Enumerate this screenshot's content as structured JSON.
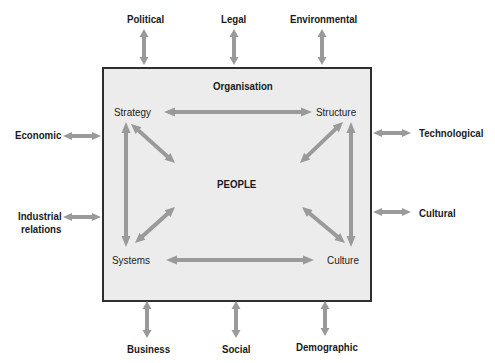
{
  "diagram": {
    "box_title": "Organisation",
    "centre_label": "PEOPLE",
    "inner_nodes": {
      "top_left": "Strategy",
      "top_right": "Structure",
      "bottom_left": "Systems",
      "bottom_right": "Culture"
    },
    "external_factors": {
      "top": [
        "Political",
        "Legal",
        "Environmental"
      ],
      "left": [
        "Economic",
        "Industrial relations"
      ],
      "left_lines": [
        [
          "Economic"
        ],
        [
          "Industrial",
          "relations"
        ]
      ],
      "right": [
        "Technological",
        "Cultural"
      ],
      "bottom": [
        "Business",
        "Social",
        "Demographic"
      ]
    },
    "colors": {
      "box_fill": "#ececec",
      "box_border": "#2e2e2e",
      "arrow": "#9a9a9a",
      "text": "#1a1a1a"
    }
  }
}
